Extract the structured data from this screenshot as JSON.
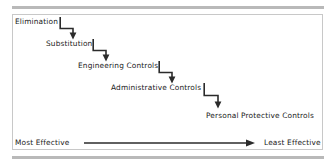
{
  "diagram": {
    "border_color": "#c8c8c8",
    "rule_color": "#b9b9b9",
    "text_color": "#1a1a1a",
    "arrow_color": "#2b2b2b",
    "steps": [
      {
        "label": "Elimination",
        "rank": 1
      },
      {
        "label": "Substitution",
        "rank": 2
      },
      {
        "label": "Engineering Controls",
        "rank": 3
      },
      {
        "label": "Administrative Controls",
        "rank": 4
      },
      {
        "label": "Personal  Protective Controls",
        "rank": 5
      }
    ],
    "scale": {
      "left_label": "Most Effective",
      "right_label": "Least Effective",
      "direction": "left-to-right"
    },
    "connectors": [
      {
        "from": "Elimination",
        "to": "Substitution",
        "shape": "elbow-down-right-down"
      },
      {
        "from": "Substitution",
        "to": "Engineering Controls",
        "shape": "elbow-down-right-down"
      },
      {
        "from": "Engineering Controls",
        "to": "Administrative Controls",
        "shape": "elbow-down-right-down"
      },
      {
        "from": "Administrative Controls",
        "to": "Personal  Protective Controls",
        "shape": "elbow-down-right-down"
      }
    ]
  }
}
